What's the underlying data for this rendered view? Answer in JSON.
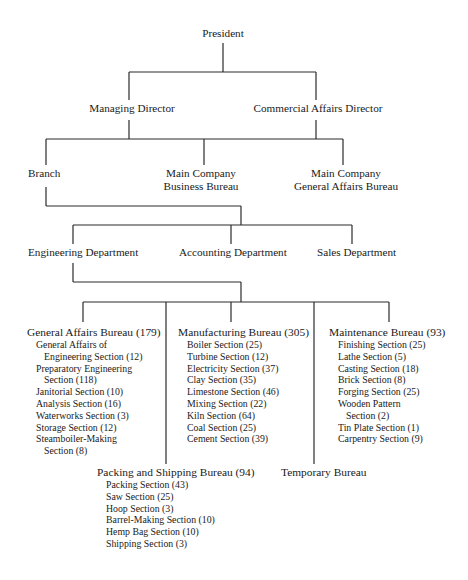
{
  "chart": {
    "top": {
      "label": "President"
    },
    "directors": [
      {
        "label": "Managing Director"
      },
      {
        "label": "Commercial Affairs Director"
      }
    ],
    "level3": [
      {
        "label": "Branch"
      },
      {
        "line1": "Main Company",
        "line2": "Business Bureau"
      },
      {
        "line1": "Main Company",
        "line2": "General Affairs Bureau"
      }
    ],
    "departments": [
      {
        "label": "Engineering Department"
      },
      {
        "label": "Accounting Department"
      },
      {
        "label": "Sales Department"
      }
    ],
    "bureaus": {
      "general_affairs": {
        "title": "General Affairs Bureau (179)",
        "sections": [
          {
            "line1": "General Affairs of",
            "line2": "Engineering Section (12)"
          },
          {
            "line1": "Preparatory Engineering",
            "line2": "Section (118)"
          },
          {
            "line1": "Janitorial Section (10)"
          },
          {
            "line1": "Analysis Section (16)"
          },
          {
            "line1": "Waterworks Section (3)"
          },
          {
            "line1": "Storage Section (12)"
          },
          {
            "line1": "Steamboiler-Making",
            "line2": "Section (8)"
          }
        ]
      },
      "manufacturing": {
        "title": "Manufacturing Bureau (305)",
        "sections": [
          {
            "line1": "Boiler Section (25)"
          },
          {
            "line1": "Turbine Section (12)"
          },
          {
            "line1": "Electricity Section (37)"
          },
          {
            "line1": "Clay Section (35)"
          },
          {
            "line1": "Limestone Section (46)"
          },
          {
            "line1": "Mixing Section (22)"
          },
          {
            "line1": "Kiln Section (64)"
          },
          {
            "line1": "Coal Section (25)"
          },
          {
            "line1": "Cement Section (39)"
          }
        ]
      },
      "maintenance": {
        "title": "Maintenance Bureau (93)",
        "sections": [
          {
            "line1": "Finishing Section (25)"
          },
          {
            "line1": "Lathe Section (5)"
          },
          {
            "line1": "Casting Section (18)"
          },
          {
            "line1": "Brick Section (8)"
          },
          {
            "line1": "Forging Section (25)"
          },
          {
            "line1": "Wooden Pattern",
            "line2": "Section (2)"
          },
          {
            "line1": "Tin Plate Section (1)"
          },
          {
            "line1": "Carpentry Section (9)"
          }
        ]
      },
      "packing_shipping": {
        "title": "Packing and Shipping Bureau (94)",
        "sections": [
          {
            "line1": "Packing Section (43)"
          },
          {
            "line1": "Saw Section (25)"
          },
          {
            "line1": "Hoop Section (3)"
          },
          {
            "line1": "Barrel-Making Section (10)"
          },
          {
            "line1": "Hemp Bag Section (10)"
          },
          {
            "line1": "Shipping Section (3)"
          }
        ]
      },
      "temporary": {
        "title": "Temporary Bureau"
      }
    }
  }
}
